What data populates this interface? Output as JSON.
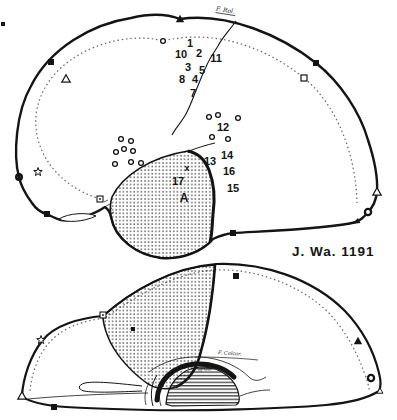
{
  "case_label": "J. Wa. 1191",
  "colors": {
    "ink": "#141414",
    "paper": "#ffffff",
    "dotted_line": "#666666"
  },
  "top_view": {
    "fissure_label": "F. Rol.",
    "numbers": {
      "1": "1",
      "2": "2",
      "3": "3",
      "4": "4",
      "5": "5",
      "7": "7",
      "8": "8",
      "10": "10",
      "11": "11",
      "12": "12",
      "13": "13",
      "14": "14",
      "15": "15",
      "16": "16",
      "17": "17"
    },
    "letter_label": "A",
    "x_label": "x"
  },
  "bottom_view": {
    "calcarine_label": "F. Calcar.",
    "vein_label": "V. of Gal."
  },
  "symbols": {
    "filled_triangle": "▲",
    "open_triangle": "△",
    "filled_square": "■",
    "open_square": "□",
    "dotted_square": "⊡",
    "star": "☆",
    "ring": "○"
  }
}
